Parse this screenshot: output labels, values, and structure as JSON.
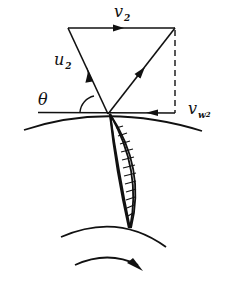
{
  "diagram": {
    "labels": {
      "v2": {
        "main": "v",
        "sub": "2"
      },
      "u2": {
        "main": "u",
        "sub": "2"
      },
      "theta": {
        "main": "θ"
      },
      "vw2": {
        "main": "v",
        "sub": "w",
        "subsub": "2"
      }
    },
    "elements": [
      {
        "name": "absolute-velocity-v2",
        "description": "horizontal vector at top of triangle, arrow pointing right"
      },
      {
        "name": "blade-velocity-u2",
        "description": "vector from outlet point up-left to top-left corner"
      },
      {
        "name": "relative-velocity",
        "description": "vector from outlet point up-right to top-right corner"
      },
      {
        "name": "vertical-dashed-line",
        "description": "dashed projection from top-right corner down to tangent line"
      },
      {
        "name": "whirl-component-vw2",
        "description": "horizontal component along tangent line, arrow pointing left"
      },
      {
        "name": "tangent-line",
        "description": "horizontal tangent at outlet point"
      },
      {
        "name": "angle-theta",
        "description": "angle between tangent line and u2"
      },
      {
        "name": "outer-rim-arc",
        "description": "outer circumference of impeller"
      },
      {
        "name": "inner-rim-arc",
        "description": "inner circumference of impeller"
      },
      {
        "name": "curved-blade",
        "description": "crescent-shaped blade with hatching"
      },
      {
        "name": "rotation-arrow",
        "description": "curved arrow indicating clockwise rotation"
      }
    ],
    "colors": {
      "stroke": "#111111",
      "background": "#ffffff"
    }
  }
}
